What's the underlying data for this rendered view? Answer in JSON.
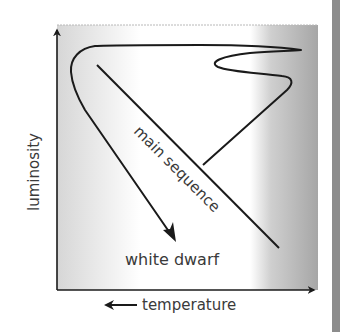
{
  "diagram": {
    "type": "Hertzsprung-Russell evolutionary track",
    "axes": {
      "y_label": "luminosity",
      "x_label": "temperature",
      "x_direction_note": "arrow points left (temperature increases to the left)"
    },
    "labels": {
      "main_sequence": "main sequence",
      "white_dwarf": "white dwarf"
    },
    "colors": {
      "line": "#1a1a1a",
      "text": "#3a3a3a",
      "gradient_left": "#d6d6d6",
      "gradient_mid": "#ffffff",
      "gradient_right": "#a6a6a6",
      "side_bar": "#8c8c8c"
    }
  }
}
